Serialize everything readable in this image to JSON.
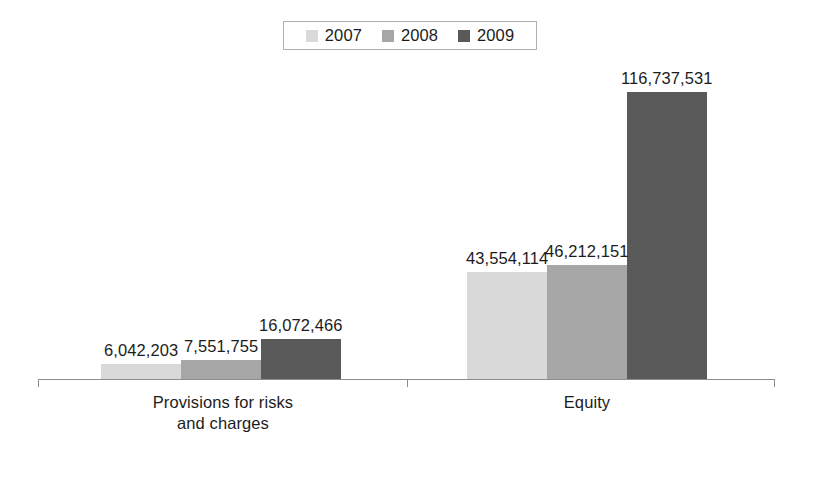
{
  "chart_data": {
    "type": "bar",
    "title": "",
    "subtitle": "",
    "xlabel": "",
    "ylabel": "",
    "grid": false,
    "legend_position": "top-center",
    "axis": {
      "baseline_value": 0,
      "max_plotted_value": 116737531,
      "ticks_visible": [
        "group-separator",
        "axis-start",
        "axis-end"
      ]
    },
    "categories": [
      "Provisions for risks and charges",
      "Equity"
    ],
    "category_lines": [
      [
        "Provisions for risks",
        "and charges"
      ],
      [
        "Equity"
      ]
    ],
    "series": [
      {
        "name": "2007",
        "color": "#d9d9d9",
        "values": [
          6042203,
          43554114
        ],
        "labels": [
          "6,042,203",
          "43,554,114"
        ]
      },
      {
        "name": "2008",
        "color": "#a6a6a6",
        "values": [
          7551755,
          46212151
        ],
        "labels": [
          "7,551,755",
          "46,212,151"
        ]
      },
      {
        "name": "2009",
        "color": "#595959",
        "values": [
          16072466,
          116737531
        ],
        "labels": [
          "16,072,466",
          "116,737,531"
        ]
      }
    ]
  },
  "legend": {
    "entries": [
      {
        "label": "2007",
        "swatch": "legend-swatch-2007"
      },
      {
        "label": "2008",
        "swatch": "legend-swatch-2008"
      },
      {
        "label": "2009",
        "swatch": "legend-swatch-2009"
      }
    ]
  },
  "colors": {
    "series_2007": "#d9d9d9",
    "series_2008": "#a6a6a6",
    "series_2009": "#595959",
    "axis": "#8d8d8d",
    "text": "#1c1c1c",
    "legend_border": "#b0b0b0",
    "background": "#ffffff"
  }
}
